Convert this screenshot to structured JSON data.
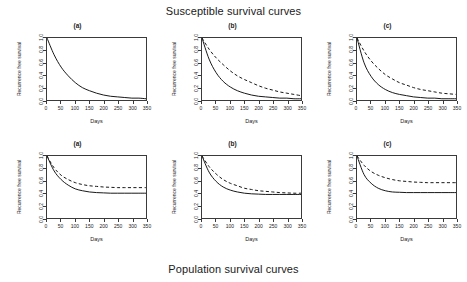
{
  "figure": {
    "top_title": "Susceptible survival curves",
    "bottom_title": "Population survival curves"
  },
  "axis": {
    "xlabel": "Days",
    "ylabel": "Recurrence free survival",
    "xticks": [
      "0",
      "50",
      "100",
      "150",
      "200",
      "250",
      "300",
      "350"
    ],
    "yticks": [
      "0.0",
      "0.2",
      "0.4",
      "0.6",
      "0.8",
      "1.0"
    ]
  },
  "panels": [
    {
      "label": "(a)",
      "row": "susceptible"
    },
    {
      "label": "(b)",
      "row": "susceptible"
    },
    {
      "label": "(c)",
      "row": "susceptible"
    },
    {
      "label": "(a)",
      "row": "population"
    },
    {
      "label": "(b)",
      "row": "population"
    },
    {
      "label": "(c)",
      "row": "population"
    }
  ],
  "chart_data": [
    {
      "type": "line",
      "title": "(a)",
      "panel": "top-left",
      "group": "Susceptible survival curves",
      "xlabel": "Days",
      "ylabel": "Recurrence free survival",
      "xlim": [
        0,
        350
      ],
      "ylim": [
        0.0,
        1.0
      ],
      "xticks": [
        0,
        50,
        100,
        150,
        200,
        250,
        300,
        350
      ],
      "yticks": [
        0.0,
        0.2,
        0.4,
        0.6,
        0.8,
        1.0
      ],
      "grid": false,
      "legend": "none",
      "x": [
        0,
        25,
        50,
        75,
        100,
        125,
        150,
        175,
        200,
        225,
        250,
        275,
        300,
        325,
        350
      ],
      "series": [
        {
          "name": "solid",
          "style": "solid",
          "values": [
            1.0,
            0.73,
            0.53,
            0.39,
            0.28,
            0.2,
            0.15,
            0.11,
            0.08,
            0.06,
            0.05,
            0.04,
            0.03,
            0.03,
            0.02
          ]
        }
      ]
    },
    {
      "type": "line",
      "title": "(b)",
      "panel": "top-middle",
      "group": "Susceptible survival curves",
      "xlabel": "Days",
      "ylabel": "Recurrence free survival",
      "xlim": [
        0,
        350
      ],
      "ylim": [
        0.0,
        1.0
      ],
      "xticks": [
        0,
        50,
        100,
        150,
        200,
        250,
        300,
        350
      ],
      "yticks": [
        0.0,
        0.2,
        0.4,
        0.6,
        0.8,
        1.0
      ],
      "grid": false,
      "legend": "none",
      "x": [
        0,
        25,
        50,
        75,
        100,
        125,
        150,
        175,
        200,
        225,
        250,
        275,
        300,
        325,
        350
      ],
      "series": [
        {
          "name": "solid",
          "style": "solid",
          "values": [
            1.0,
            0.66,
            0.44,
            0.3,
            0.21,
            0.15,
            0.11,
            0.08,
            0.06,
            0.05,
            0.04,
            0.03,
            0.03,
            0.02,
            0.02
          ]
        },
        {
          "name": "dashed",
          "style": "dashed",
          "values": [
            1.0,
            0.82,
            0.68,
            0.57,
            0.47,
            0.39,
            0.33,
            0.28,
            0.23,
            0.19,
            0.16,
            0.13,
            0.11,
            0.09,
            0.07
          ]
        }
      ]
    },
    {
      "type": "line",
      "title": "(c)",
      "panel": "top-right",
      "group": "Susceptible survival curves",
      "xlabel": "Days",
      "ylabel": "Recurrence free survival",
      "xlim": [
        0,
        350
      ],
      "ylim": [
        0.0,
        1.0
      ],
      "xticks": [
        0,
        50,
        100,
        150,
        200,
        250,
        300,
        350
      ],
      "yticks": [
        0.0,
        0.2,
        0.4,
        0.6,
        0.8,
        1.0
      ],
      "grid": false,
      "legend": "none",
      "x": [
        0,
        25,
        50,
        75,
        100,
        125,
        150,
        175,
        200,
        225,
        250,
        275,
        300,
        325,
        350
      ],
      "series": [
        {
          "name": "solid",
          "style": "solid",
          "values": [
            1.0,
            0.6,
            0.38,
            0.25,
            0.17,
            0.12,
            0.09,
            0.07,
            0.05,
            0.04,
            0.03,
            0.03,
            0.02,
            0.02,
            0.02
          ]
        },
        {
          "name": "dashed",
          "style": "dashed",
          "values": [
            1.0,
            0.79,
            0.63,
            0.51,
            0.41,
            0.34,
            0.28,
            0.24,
            0.2,
            0.17,
            0.15,
            0.13,
            0.11,
            0.1,
            0.09
          ]
        }
      ]
    },
    {
      "type": "line",
      "title": "(a)",
      "panel": "bottom-left",
      "group": "Population survival curves",
      "xlabel": "Days",
      "ylabel": "Recurrence free survival",
      "xlim": [
        0,
        350
      ],
      "ylim": [
        0.0,
        1.0
      ],
      "xticks": [
        0,
        50,
        100,
        150,
        200,
        250,
        300,
        350
      ],
      "yticks": [
        0.0,
        0.2,
        0.4,
        0.6,
        0.8,
        1.0
      ],
      "grid": false,
      "legend": "none",
      "x": [
        0,
        25,
        50,
        75,
        100,
        125,
        150,
        175,
        200,
        225,
        250,
        275,
        300,
        325,
        350
      ],
      "series": [
        {
          "name": "solid",
          "style": "solid",
          "values": [
            1.0,
            0.76,
            0.62,
            0.53,
            0.47,
            0.44,
            0.42,
            0.41,
            0.405,
            0.4,
            0.4,
            0.4,
            0.4,
            0.4,
            0.4
          ]
        },
        {
          "name": "dashed",
          "style": "dashed",
          "values": [
            1.0,
            0.81,
            0.69,
            0.62,
            0.57,
            0.54,
            0.52,
            0.51,
            0.5,
            0.495,
            0.49,
            0.49,
            0.49,
            0.49,
            0.49
          ]
        }
      ]
    },
    {
      "type": "line",
      "title": "(b)",
      "panel": "bottom-middle",
      "group": "Population survival curves",
      "xlabel": "Days",
      "ylabel": "Recurrence free survival",
      "xlim": [
        0,
        350
      ],
      "ylim": [
        0.0,
        1.0
      ],
      "xticks": [
        0,
        50,
        100,
        150,
        200,
        250,
        300,
        350
      ],
      "yticks": [
        0.0,
        0.2,
        0.4,
        0.6,
        0.8,
        1.0
      ],
      "grid": false,
      "legend": "none",
      "x": [
        0,
        25,
        50,
        75,
        100,
        125,
        150,
        175,
        200,
        225,
        250,
        275,
        300,
        325,
        350
      ],
      "series": [
        {
          "name": "solid",
          "style": "solid",
          "values": [
            1.0,
            0.74,
            0.59,
            0.5,
            0.45,
            0.42,
            0.4,
            0.39,
            0.385,
            0.38,
            0.38,
            0.38,
            0.38,
            0.38,
            0.38
          ]
        },
        {
          "name": "dashed",
          "style": "dashed",
          "values": [
            1.0,
            0.83,
            0.71,
            0.62,
            0.56,
            0.52,
            0.48,
            0.46,
            0.44,
            0.43,
            0.42,
            0.41,
            0.405,
            0.4,
            0.4
          ]
        }
      ]
    },
    {
      "type": "line",
      "title": "(c)",
      "panel": "bottom-right",
      "group": "Population survival curves",
      "xlabel": "Days",
      "ylabel": "Recurrence free survival",
      "xlim": [
        0,
        350
      ],
      "ylim": [
        0.0,
        1.0
      ],
      "xticks": [
        0,
        50,
        100,
        150,
        200,
        250,
        300,
        350
      ],
      "yticks": [
        0.0,
        0.2,
        0.4,
        0.6,
        0.8,
        1.0
      ],
      "grid": false,
      "legend": "none",
      "x": [
        0,
        25,
        50,
        75,
        100,
        125,
        150,
        175,
        200,
        225,
        250,
        275,
        300,
        325,
        350
      ],
      "series": [
        {
          "name": "solid",
          "style": "solid",
          "values": [
            1.0,
            0.7,
            0.56,
            0.48,
            0.44,
            0.42,
            0.415,
            0.41,
            0.41,
            0.41,
            0.41,
            0.41,
            0.41,
            0.41,
            0.41
          ]
        },
        {
          "name": "dashed",
          "style": "dashed",
          "values": [
            1.0,
            0.85,
            0.75,
            0.69,
            0.65,
            0.62,
            0.6,
            0.59,
            0.58,
            0.575,
            0.57,
            0.57,
            0.57,
            0.57,
            0.57
          ]
        }
      ]
    }
  ],
  "style": {
    "line_color": "#111111",
    "axis_color": "#3a3a3a",
    "background": "#ffffff"
  }
}
